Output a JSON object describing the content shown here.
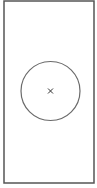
{
  "diagram": {
    "frame": {
      "x": 4,
      "y": 1,
      "width": 90,
      "height": 182,
      "stroke": "#555555",
      "stroke_width": 1.5
    },
    "circle": {
      "cx": 50.5,
      "cy": 91,
      "r": 29.5,
      "stroke": "#6a6a6a",
      "stroke_width": 1.2
    },
    "center_marker": {
      "x": 50.5,
      "y": 91,
      "size": 2.5,
      "symbol": "x-mark-icon",
      "stroke": "#333333"
    }
  }
}
